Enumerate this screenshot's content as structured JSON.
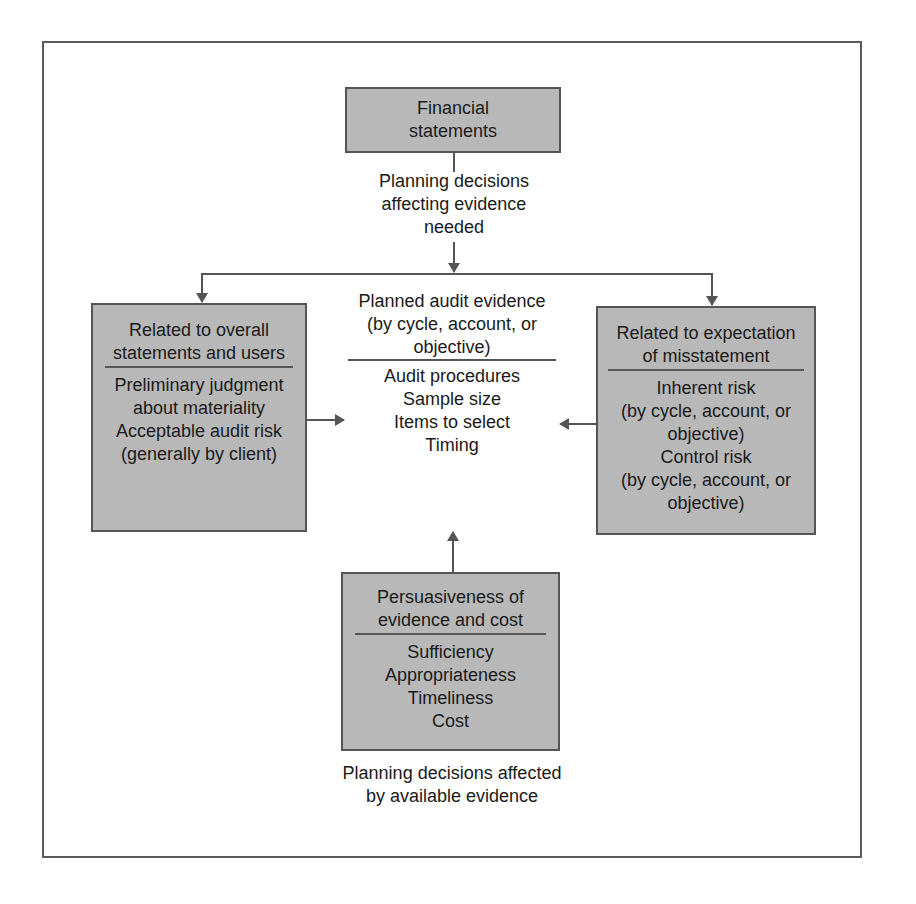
{
  "diagram": {
    "top_box": {
      "lines": [
        "Financial",
        "statements"
      ]
    },
    "top_label": {
      "lines": [
        "Planning decisions",
        "affecting evidence",
        "needed"
      ]
    },
    "left_box": {
      "header": [
        "Related to overall",
        "statements and users"
      ],
      "items": [
        "Preliminary judgment",
        "about materiality",
        "Acceptable audit risk",
        "(generally by client)"
      ]
    },
    "center": {
      "header": [
        "Planned audit evidence",
        "(by cycle, account, or",
        "objective)"
      ],
      "items": [
        "Audit procedures",
        "Sample size",
        "Items to select",
        "Timing"
      ]
    },
    "right_box": {
      "header": [
        "Related to expectation",
        "of misstatement"
      ],
      "items": [
        "Inherent risk",
        "(by cycle, account, or",
        "objective)",
        "Control risk",
        "(by cycle, account, or",
        "objective)"
      ]
    },
    "bottom_box": {
      "header": [
        "Persuasiveness of",
        "evidence and cost"
      ],
      "items": [
        "Sufficiency",
        "Appropriateness",
        "Timeliness",
        "Cost"
      ]
    },
    "bottom_label": {
      "lines": [
        "Planning decisions affected",
        "by available evidence"
      ]
    },
    "colors": {
      "box_fill": "#b8b8b8",
      "line": "#555555",
      "text": "#1a1a1a"
    }
  }
}
